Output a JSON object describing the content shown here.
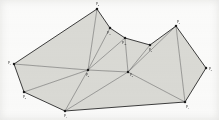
{
  "figure": {
    "kind": "planar-triangulation",
    "caption": "",
    "fill_color": "#dcdcd8",
    "edge_color": "#3a3a3a",
    "hull_edge_color": "#2a2a2a",
    "vertex_color": "#1c1c1c",
    "background_color": "#fdfdfd",
    "label_color": "#2b2b2b"
  },
  "vertices": [
    {
      "id": "p0",
      "label": "p",
      "sub": "0",
      "x": 88,
      "y": 70,
      "label_dx": -2,
      "label_dy": 5
    },
    {
      "id": "p1",
      "label": "p",
      "sub": "1",
      "x": 65,
      "y": 111,
      "label_dx": -1,
      "label_dy": 5
    },
    {
      "id": "p2",
      "label": "p",
      "sub": "2",
      "x": 24,
      "y": 92,
      "label_dx": -1,
      "label_dy": 5
    },
    {
      "id": "p3",
      "label": "p",
      "sub": "3",
      "x": 14,
      "y": 64,
      "label_dx": -6,
      "label_dy": -1
    },
    {
      "id": "p4",
      "label": "p",
      "sub": "4",
      "x": 97,
      "y": 9,
      "label_dx": -1,
      "label_dy": -5
    },
    {
      "id": "p5",
      "label": "p",
      "sub": "5",
      "x": 176,
      "y": 26,
      "label_dx": 1,
      "label_dy": -4
    },
    {
      "id": "p6",
      "label": "p",
      "sub": "6",
      "x": 206,
      "y": 68,
      "label_dx": 3,
      "label_dy": 1
    },
    {
      "id": "p7",
      "label": "p",
      "sub": "7",
      "x": 185,
      "y": 102,
      "label_dx": 1,
      "label_dy": 5
    },
    {
      "id": "p8",
      "label": "p",
      "sub": "8",
      "x": 150,
      "y": 45,
      "label_dx": -1,
      "label_dy": 5
    },
    {
      "id": "p9",
      "label": "p",
      "sub": "9",
      "x": 128,
      "y": 72,
      "label_dx": 2,
      "label_dy": 3
    },
    {
      "id": "p10",
      "label": "p",
      "sub": "10",
      "x": 125,
      "y": 38,
      "label_dx": -3,
      "label_dy": 5
    },
    {
      "id": "p11",
      "label": "p",
      "sub": "11",
      "x": 110,
      "y": 28,
      "label_dx": -3,
      "label_dy": 5
    }
  ],
  "hull": [
    "p4",
    "p5",
    "p6",
    "p7",
    "p1",
    "p2",
    "p3"
  ],
  "edges": [
    {
      "from": "p3",
      "to": "p4",
      "kind": "hull"
    },
    {
      "from": "p4",
      "to": "p11",
      "kind": "hull"
    },
    {
      "from": "p11",
      "to": "p10",
      "kind": "hull"
    },
    {
      "from": "p10",
      "to": "p8",
      "kind": "hull"
    },
    {
      "from": "p8",
      "to": "p5",
      "kind": "hull"
    },
    {
      "from": "p5",
      "to": "p6",
      "kind": "hull"
    },
    {
      "from": "p6",
      "to": "p7",
      "kind": "hull"
    },
    {
      "from": "p7",
      "to": "p1",
      "kind": "hull"
    },
    {
      "from": "p1",
      "to": "p2",
      "kind": "hull"
    },
    {
      "from": "p2",
      "to": "p3",
      "kind": "hull"
    },
    {
      "from": "p0",
      "to": "p3",
      "kind": "interior"
    },
    {
      "from": "p0",
      "to": "p2",
      "kind": "interior"
    },
    {
      "from": "p0",
      "to": "p1",
      "kind": "interior"
    },
    {
      "from": "p0",
      "to": "p4",
      "kind": "interior"
    },
    {
      "from": "p0",
      "to": "p11",
      "kind": "interior"
    },
    {
      "from": "p0",
      "to": "p10",
      "kind": "interior"
    },
    {
      "from": "p0",
      "to": "p9",
      "kind": "interior"
    },
    {
      "from": "p9",
      "to": "p10",
      "kind": "interior"
    },
    {
      "from": "p9",
      "to": "p8",
      "kind": "interior"
    },
    {
      "from": "p9",
      "to": "p5",
      "kind": "interior"
    },
    {
      "from": "p9",
      "to": "p7",
      "kind": "interior"
    },
    {
      "from": "p9",
      "to": "p1",
      "kind": "interior"
    },
    {
      "from": "p5",
      "to": "p7",
      "kind": "interior"
    }
  ],
  "faces": [
    {
      "id": "f1",
      "verts": [
        "p3",
        "p4",
        "p0"
      ]
    },
    {
      "id": "f2",
      "verts": [
        "p3",
        "p0",
        "p2"
      ]
    },
    {
      "id": "f3",
      "verts": [
        "p2",
        "p0",
        "p1"
      ]
    },
    {
      "id": "f4",
      "verts": [
        "p4",
        "p11",
        "p0"
      ]
    },
    {
      "id": "f5",
      "verts": [
        "p11",
        "p10",
        "p0"
      ]
    },
    {
      "id": "f6",
      "verts": [
        "p10",
        "p9",
        "p0"
      ]
    },
    {
      "id": "f7",
      "verts": [
        "p10",
        "p8",
        "p9"
      ]
    },
    {
      "id": "f8",
      "verts": [
        "p8",
        "p5",
        "p9"
      ]
    },
    {
      "id": "f9",
      "verts": [
        "p5",
        "p6",
        "p7"
      ]
    },
    {
      "id": "f10",
      "verts": [
        "p5",
        "p7",
        "p9"
      ]
    },
    {
      "id": "f11",
      "verts": [
        "p9",
        "p7",
        "p1"
      ]
    },
    {
      "id": "f12",
      "verts": [
        "p0",
        "p9",
        "p1"
      ]
    }
  ]
}
